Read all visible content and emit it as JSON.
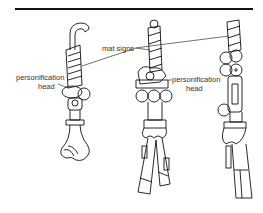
{
  "figure": {
    "labels": {
      "mat_signs": "mat signs",
      "personification_head_left_1": "personification",
      "personification_head_left_2": "head",
      "personification_head_mid_1": "personification",
      "personification_head_mid_2": "head"
    },
    "colors": {
      "line": "#111111",
      "background": "#ffffff",
      "label": "#333333"
    }
  }
}
